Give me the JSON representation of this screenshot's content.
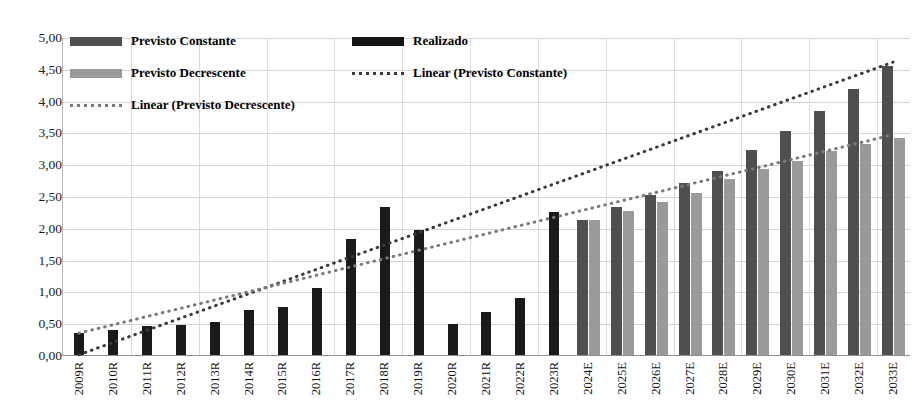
{
  "chart_data": {
    "type": "bar",
    "title": "",
    "xlabel": "",
    "ylabel": "",
    "ylim": [
      0,
      5
    ],
    "ytick_step": 0.5,
    "grid": true,
    "legend_position": "top-left-inside",
    "decimal_separator": ",",
    "ytick_labels": [
      "5,00",
      "4,50",
      "4,00",
      "3,50",
      "3,00",
      "2,50",
      "2,00",
      "1,50",
      "1,00",
      "0,50",
      "0,00"
    ],
    "ytick_values": [
      5.0,
      4.5,
      4.0,
      3.5,
      3.0,
      2.5,
      2.0,
      1.5,
      1.0,
      0.5,
      0.0
    ],
    "categories": [
      "2009R",
      "2010R",
      "2011R",
      "2012R",
      "2013R",
      "2014R",
      "2015R",
      "2016R",
      "2017R",
      "2018R",
      "2019R",
      "2020R",
      "2021R",
      "2022R",
      "2023R",
      "2024E",
      "2025E",
      "2026E",
      "2027E",
      "2028E",
      "2029E",
      "2030E",
      "2031E",
      "2032E",
      "2033E"
    ],
    "series": [
      {
        "name": "Realizado",
        "color": "#1a1a1a",
        "kind": "bar",
        "values": [
          0.35,
          0.4,
          0.45,
          0.47,
          0.52,
          0.7,
          0.75,
          1.05,
          1.82,
          2.32,
          1.96,
          0.49,
          0.67,
          0.89,
          2.25,
          null,
          null,
          null,
          null,
          null,
          null,
          null,
          null,
          null,
          null
        ]
      },
      {
        "name": "Previsto Constante",
        "color": "#4f4f4f",
        "kind": "bar",
        "values": [
          null,
          null,
          null,
          null,
          null,
          null,
          null,
          null,
          null,
          null,
          null,
          null,
          null,
          null,
          null,
          2.13,
          2.32,
          2.51,
          2.7,
          2.9,
          3.22,
          3.52,
          3.84,
          4.18,
          4.54
        ]
      },
      {
        "name": "Previsto Decrescente",
        "color": "#9a9a9a",
        "kind": "bar",
        "values": [
          null,
          null,
          null,
          null,
          null,
          null,
          null,
          null,
          null,
          null,
          null,
          null,
          null,
          null,
          null,
          2.13,
          2.27,
          2.4,
          2.55,
          2.77,
          2.93,
          3.05,
          3.21,
          3.32,
          3.41
        ]
      },
      {
        "name": "Linear (Previsto Constante)",
        "color": "#3a3a3a",
        "kind": "trendline-dotted",
        "x_start": "2009R",
        "x_end": "2033E",
        "y_start": 0.02,
        "y_end": 4.62
      },
      {
        "name": "Linear (Previsto Decrescente)",
        "color": "#7a7a7a",
        "kind": "trendline-dotted",
        "x_start": "2009R",
        "x_end": "2033E",
        "y_start": 0.36,
        "y_end": 3.48
      }
    ],
    "legend": [
      {
        "label": "Previsto Constante",
        "marker": "swatch",
        "color": "#4f4f4f"
      },
      {
        "label": "Realizado",
        "marker": "swatch",
        "color": "#151515"
      },
      {
        "label": "Previsto Decrescente",
        "marker": "swatch",
        "color": "#9a9a9a"
      },
      {
        "label": "Linear (Previsto Constante)",
        "marker": "dotted-line",
        "color": "#3a3a3a"
      },
      {
        "label": "Linear (Previsto Decrescente)",
        "marker": "dotted-line",
        "color": "#7a7a7a"
      }
    ]
  }
}
